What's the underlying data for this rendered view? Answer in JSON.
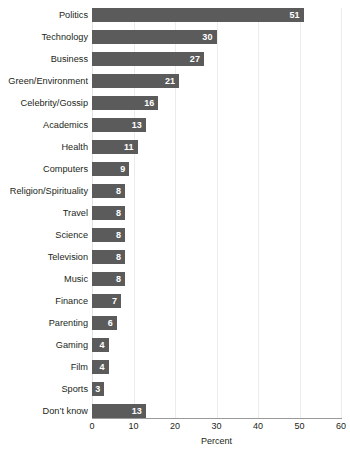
{
  "chart_data": {
    "type": "bar",
    "orientation": "horizontal",
    "title": "",
    "xlabel": "Percent",
    "ylabel": "",
    "xlim": [
      0,
      60
    ],
    "xticks": [
      0,
      10,
      20,
      30,
      40,
      50,
      60
    ],
    "grid": true,
    "legend": false,
    "categories": [
      "Politics",
      "Technology",
      "Business",
      "Green/Environment",
      "Celebrity/Gossip",
      "Academics",
      "Health",
      "Computers",
      "Religion/Spirituality",
      "Travel",
      "Science",
      "Television",
      "Music",
      "Finance",
      "Parenting",
      "Gaming",
      "Film",
      "Sports",
      "Don’t know"
    ],
    "values": [
      51,
      30,
      27,
      21,
      16,
      13,
      11,
      9,
      8,
      8,
      8,
      8,
      8,
      7,
      6,
      4,
      4,
      3,
      13
    ],
    "value_labels": [
      "51",
      "30",
      "27",
      "21",
      "16",
      "13",
      "11",
      "9",
      "8",
      "8",
      "8",
      "8",
      "8",
      "7",
      "6",
      "4",
      "4",
      "3",
      "13"
    ],
    "bar_color": "#5b5b5b",
    "value_label_color": "#ffffff",
    "gridline_color": "#ececec",
    "axis_color": "#9a9a9a",
    "text_color": "#231f20",
    "background_color": "#ffffff"
  }
}
